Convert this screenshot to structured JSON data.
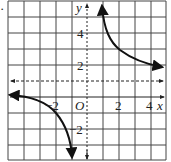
{
  "figure": {
    "marker": "·",
    "axes": {
      "x_label": "x",
      "y_label": "y",
      "origin_label": "O",
      "x_range": [
        -5,
        5
      ],
      "y_range": [
        -4,
        6
      ],
      "x_tick_labels": [
        {
          "value": -2,
          "text": "−2"
        },
        {
          "value": 2,
          "text": "2"
        },
        {
          "value": 4,
          "text": "4"
        }
      ],
      "y_tick_labels": [
        {
          "value": 4,
          "text": "4"
        },
        {
          "value": 2,
          "text": "2"
        },
        {
          "value": -2,
          "text": "−2"
        }
      ]
    },
    "asymptotes": {
      "horizontal_y": 1,
      "vertical_x": 0
    },
    "grid": true,
    "curves": [
      "right-branch",
      "left-branch"
    ]
  }
}
